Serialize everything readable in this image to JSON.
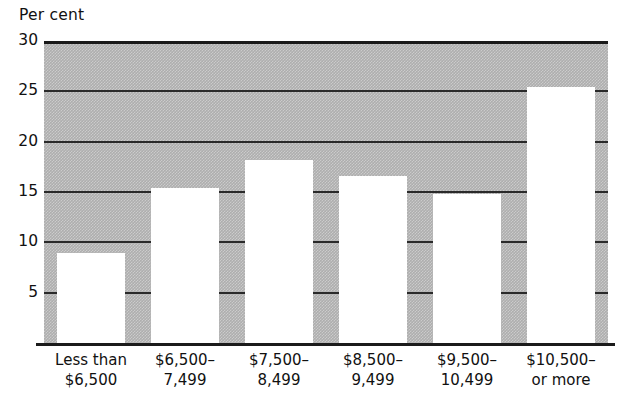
{
  "chart_data": {
    "type": "bar",
    "title": "",
    "ylabel": "Per cent",
    "xlabel": "",
    "ylim": [
      0,
      30
    ],
    "yticks": [
      5,
      10,
      15,
      20,
      25,
      30
    ],
    "ytick_labels": [
      "5",
      "10",
      "15",
      "20",
      "25",
      "30"
    ],
    "grid": true,
    "legend": null,
    "categories": [
      "Less than $6,500",
      "$6,500–7,499",
      "$7,500–8,499",
      "$8,500–9,499",
      "$9,500–10,499",
      "$10,500– or more"
    ],
    "category_lines": [
      {
        "line1": "Less than",
        "line2": "$6,500"
      },
      {
        "line1": "$6,500–",
        "line2": "7,499"
      },
      {
        "line1": "$7,500–",
        "line2": "8,499"
      },
      {
        "line1": "$8,500–",
        "line2": "9,499"
      },
      {
        "line1": "$9,500–",
        "line2": "10,499"
      },
      {
        "line1": "$10,500–",
        "line2": "or more"
      }
    ],
    "values": [
      8.9,
      15.4,
      18.2,
      16.6,
      14.8,
      25.4
    ],
    "colors": {
      "plot_background": "#aeaeae",
      "bar_fill": "#ffffff",
      "gridline": "#2a2a2a",
      "axis": "#1b1b1b",
      "text": "#111111"
    }
  }
}
